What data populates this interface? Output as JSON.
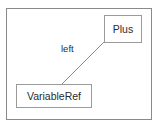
{
  "diagram": {
    "type": "node-link-graph",
    "background_color": "#ffffff",
    "frame": {
      "name": "diagram-frame",
      "border_color": "#8a8a8a"
    },
    "nodes": [
      {
        "id": "plus",
        "label": "Plus",
        "border_color": "#9a9a9a",
        "fill_color": "#ffffff",
        "text_color": "#2b2b2b"
      },
      {
        "id": "variableref",
        "label": "VariableRef",
        "border_color": "#9a9a9a",
        "fill_color": "#ffffff",
        "text_color": "#2b2b2b"
      }
    ],
    "edges": [
      {
        "id": "plus-left-variableref",
        "source": "plus",
        "target": "variableref",
        "label": "left",
        "line_color": "#8a8a8a",
        "text_color": "#2b2b2b"
      }
    ]
  }
}
